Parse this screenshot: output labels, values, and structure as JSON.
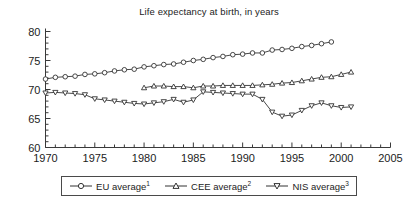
{
  "chart_data": {
    "type": "line",
    "title": "Life expectancy at birth, in years",
    "xlabel": "",
    "ylabel": "",
    "xlim": [
      1970,
      2005
    ],
    "ylim": [
      60,
      80
    ],
    "xticks": [
      1970,
      1975,
      1980,
      1985,
      1990,
      1995,
      2000,
      2005
    ],
    "yticks": [
      60,
      65,
      70,
      75,
      80
    ],
    "xtick_labels": [
      "1970",
      "1975",
      "1980",
      "1985",
      "1990",
      "1995",
      "2000",
      "2005"
    ],
    "ytick_labels": [
      "60",
      "65",
      "70",
      "75",
      "80"
    ],
    "x_minor_tick_interval": 1,
    "y_minor_tick_interval": 1,
    "grid": false,
    "legend_position": "below-axes",
    "series": [
      {
        "name": "EU average",
        "footnote": "1",
        "marker": "circle",
        "x": [
          1970,
          1971,
          1972,
          1973,
          1974,
          1975,
          1976,
          1977,
          1978,
          1979,
          1980,
          1981,
          1982,
          1983,
          1984,
          1985,
          1986,
          1987,
          1988,
          1989,
          1990,
          1991,
          1992,
          1993,
          1994,
          1995,
          1996,
          1997,
          1998,
          1999
        ],
        "values": [
          71.8,
          72.1,
          72.2,
          72.3,
          72.6,
          72.7,
          72.9,
          73.2,
          73.4,
          73.5,
          73.9,
          74.1,
          74.3,
          74.4,
          74.7,
          75.0,
          75.2,
          75.5,
          75.7,
          76.0,
          76.1,
          76.3,
          76.3,
          76.8,
          76.9,
          77.1,
          77.4,
          77.6,
          77.9,
          78.2
        ]
      },
      {
        "name": "CEE average",
        "footnote": "2",
        "marker": "triangle-up",
        "x": [
          1980,
          1981,
          1982,
          1983,
          1984,
          1985,
          1986,
          1987,
          1988,
          1989,
          1990,
          1991,
          1992,
          1993,
          1994,
          1995,
          1996,
          1997,
          1998,
          1999,
          2000,
          2001
        ],
        "values": [
          70.3,
          70.6,
          70.6,
          70.5,
          70.5,
          70.3,
          70.6,
          70.6,
          70.7,
          70.7,
          70.7,
          70.7,
          70.8,
          70.9,
          71.1,
          71.2,
          71.5,
          71.8,
          72.1,
          72.2,
          72.6,
          73.0
        ]
      },
      {
        "name": "NIS average",
        "footnote": "3",
        "marker": "triangle-down",
        "x": [
          1970,
          1971,
          1972,
          1973,
          1974,
          1975,
          1976,
          1977,
          1978,
          1979,
          1980,
          1981,
          1982,
          1983,
          1984,
          1985,
          1986,
          1987,
          1988,
          1989,
          1990,
          1991,
          1992,
          1993,
          1994,
          1995,
          1996,
          1997,
          1998,
          1999,
          2000,
          2001
        ],
        "values": [
          69.4,
          69.5,
          69.4,
          69.3,
          69.1,
          68.4,
          68.2,
          68.0,
          67.8,
          67.6,
          67.5,
          67.7,
          67.9,
          68.3,
          67.8,
          68.2,
          69.6,
          69.5,
          69.4,
          69.3,
          69.2,
          69.2,
          68.3,
          66.1,
          65.4,
          65.6,
          66.4,
          67.2,
          67.7,
          67.2,
          66.9,
          67.0
        ]
      }
    ]
  },
  "legend": {
    "entries": [
      {
        "label": "EU average",
        "footnote": "1"
      },
      {
        "label": "CEE average",
        "footnote": "2"
      },
      {
        "label": "NIS average",
        "footnote": "3"
      }
    ]
  },
  "colors": {
    "line": "#333333",
    "axis": "#3a3a3a",
    "text": "#1c1c1c",
    "marker_fill": "#ffffff"
  }
}
